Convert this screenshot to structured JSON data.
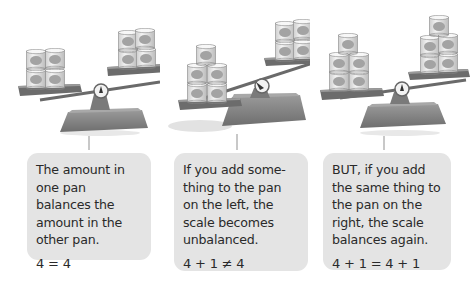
{
  "illustration": {
    "title": "Balance scale examples",
    "colors": {
      "scale_body": "#8a8a8a",
      "scale_dark": "#5e5e5e",
      "can_body": "#e9e9e9",
      "can_label": "#9a9a9a",
      "card_bg": "#e4e4e4",
      "text": "#2a2a2a"
    },
    "panels": [
      {
        "id": "balanced",
        "left_cans": 4,
        "right_cans": 4,
        "tilt": "level",
        "description": "The amount in one pan balances the amount in the other pan.",
        "equation": "4 = 4"
      },
      {
        "id": "unbalanced",
        "left_cans": 5,
        "right_cans": 4,
        "tilt": "left-down",
        "description": "If you add some-thing to the pan on the left, the scale becomes unbalanced.",
        "equation": "4 + 1 ≠ 4"
      },
      {
        "id": "rebalanced",
        "left_cans": 5,
        "right_cans": 5,
        "tilt": "level",
        "description": "BUT, if you add the same thing to the pan on the right, the scale balances again.",
        "equation": "4 + 1 = 4 + 1"
      }
    ]
  }
}
